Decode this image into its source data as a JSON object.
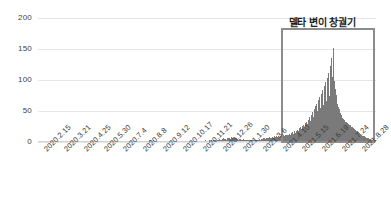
{
  "chart_data": {
    "type": "bar",
    "title": "",
    "xlabel": "",
    "ylabel": "",
    "ylim": [
      0,
      200
    ],
    "grid": true,
    "legend": null,
    "y_ticks": [
      0,
      50,
      100,
      150,
      200
    ],
    "y_tick_labels": [
      "0",
      "50",
      "100",
      "150",
      "200"
    ],
    "x_tick_labels": [
      "2020.2.15",
      "2020.3.21",
      "2020.4.25",
      "2020.5.30",
      "2020.7.4",
      "2020.8.8",
      "2020.9.12",
      "2020.10.17",
      "2020.11.21",
      "2020.12.26",
      "2021.1.30",
      "2021.3.6",
      "2021.4.10",
      "2021.5.15",
      "2021.6.19",
      "2021.7.24",
      "2021.8.28"
    ],
    "bar_color": "#7a7a7a",
    "grid_color": "#e6e6e6",
    "annotations": [
      {
        "name": "delta-outbreak-highlight",
        "label": "델타 변이 창궐기",
        "x_start_label": "2021.4.10",
        "x_end_label": "2021.8.28",
        "border_color": "#8c8c8c"
      }
    ],
    "values": [
      0,
      0,
      0,
      0,
      0,
      0,
      0,
      0,
      0,
      0,
      0,
      0,
      0,
      0,
      0,
      0,
      0,
      0,
      0,
      0,
      0,
      0,
      0,
      0,
      0,
      0,
      0,
      0,
      0,
      0,
      0,
      0,
      0,
      0,
      0,
      0,
      0,
      0,
      0,
      0,
      0,
      0,
      0,
      0,
      0,
      0,
      0,
      0,
      0,
      0,
      0,
      0,
      0,
      0,
      0,
      0,
      0,
      0,
      0,
      0,
      0,
      0,
      0,
      0,
      0,
      0,
      0,
      0,
      0,
      0,
      0,
      0,
      0,
      0,
      0,
      0,
      0,
      0,
      0,
      0,
      0,
      0,
      0,
      0,
      0,
      0,
      0,
      0,
      0,
      0,
      0,
      0,
      0,
      0,
      0,
      0,
      0,
      0,
      0,
      0,
      0,
      0,
      0,
      0,
      0,
      0,
      0,
      0,
      0,
      0,
      0,
      0,
      0,
      0,
      0,
      0,
      0,
      0,
      0,
      0,
      0,
      0,
      0,
      0,
      0,
      0,
      0,
      0,
      0,
      0,
      0,
      0,
      0,
      0,
      0,
      0,
      0,
      0,
      0,
      1,
      0,
      1,
      0,
      0,
      1,
      1,
      0,
      2,
      1,
      2,
      1,
      3,
      2,
      3,
      2,
      2,
      3,
      2,
      2,
      1,
      2,
      1,
      2,
      1,
      1,
      2,
      1,
      1,
      0,
      1,
      1,
      0,
      1,
      0,
      1,
      1,
      0,
      1,
      0,
      1,
      0,
      0,
      1,
      0,
      1,
      0,
      0,
      0,
      1,
      0,
      0,
      1,
      0,
      0,
      0,
      0,
      1,
      0,
      0,
      0,
      0,
      1,
      0,
      0,
      0,
      1,
      0,
      0,
      1,
      0,
      1,
      0,
      1,
      1,
      0,
      1,
      1,
      2,
      1,
      1,
      2,
      1,
      2,
      1,
      2,
      2,
      1,
      3,
      2,
      2,
      1,
      2,
      2,
      3,
      2,
      2,
      3,
      2,
      4,
      3,
      2,
      3,
      2,
      3,
      4,
      3,
      5,
      4,
      3,
      4,
      5,
      4,
      6,
      5,
      4,
      5,
      4,
      6,
      5,
      7,
      6,
      5,
      6,
      8,
      6,
      7,
      5,
      6,
      7,
      5,
      6,
      5,
      4,
      5,
      4,
      5,
      4,
      3,
      4,
      5,
      4,
      3,
      4,
      3,
      4,
      3,
      4,
      3,
      2,
      3,
      4,
      3,
      2,
      3,
      4,
      3,
      4,
      3,
      4,
      3,
      4,
      5,
      4,
      5,
      4,
      5,
      6,
      5,
      6,
      5,
      6,
      7,
      6,
      7,
      6,
      8,
      7,
      6,
      7,
      8,
      7,
      9,
      8,
      7,
      9,
      8,
      10,
      9,
      8,
      10,
      9,
      11,
      10,
      9,
      11,
      10,
      12,
      11,
      10,
      12,
      11,
      13,
      12,
      11,
      14,
      12,
      16,
      13,
      14,
      17,
      15,
      18,
      16,
      20,
      17,
      22,
      19,
      24,
      21,
      26,
      23,
      28,
      25,
      30,
      27,
      33,
      29,
      36,
      31,
      40,
      34,
      44,
      37,
      48,
      41,
      53,
      44,
      58,
      47,
      62,
      50,
      67,
      52,
      72,
      55,
      78,
      57,
      84,
      60,
      90,
      63,
      97,
      66,
      104,
      70,
      112,
      75,
      122,
      85,
      136,
      105,
      151,
      118,
      99,
      86,
      76,
      68,
      62,
      57,
      53,
      49,
      46,
      43,
      41,
      39,
      37,
      36,
      34,
      33,
      32,
      31,
      30,
      29,
      28,
      27,
      26,
      25,
      24,
      23,
      22,
      21,
      20,
      19,
      18,
      17,
      16,
      15,
      14,
      13,
      12,
      11,
      10,
      9,
      9,
      8,
      8,
      7,
      7,
      6,
      6,
      5,
      5,
      5,
      4,
      4,
      4,
      3,
      3,
      3,
      3
    ],
    "peak_value": 151,
    "peak_x_label": "2021.7.24"
  }
}
